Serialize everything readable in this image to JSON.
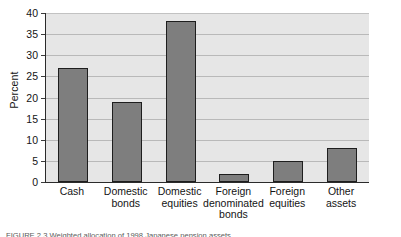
{
  "chart_data": {
    "type": "bar",
    "title": "",
    "xlabel": "",
    "ylabel": "Percent",
    "ylim": [
      0,
      40
    ],
    "ytick_step": 5,
    "grid": true,
    "legend": false,
    "categories": [
      "Cash",
      "Domestic bonds",
      "Domestic equities",
      "Foreign denominated bonds",
      "Foreign equities",
      "Other assets"
    ],
    "category_lines": [
      [
        "Cash"
      ],
      [
        "Domestic",
        "bonds"
      ],
      [
        "Domestic",
        "equities"
      ],
      [
        "Foreign",
        "denominated",
        "bonds"
      ],
      [
        "Foreign",
        "equities"
      ],
      [
        "Other",
        "assets"
      ]
    ],
    "values": [
      27,
      19,
      38,
      2,
      5,
      8
    ],
    "ytick_labels": [
      "0",
      "5",
      "10",
      "15",
      "20",
      "25",
      "30",
      "35",
      "40"
    ]
  },
  "axis": {
    "y_title": "Percent"
  },
  "colors": {
    "bar_fill": "#7e7e7e",
    "bar_outline": "#1e1e1e",
    "plot_background": "#e6e6e6",
    "gridline": "#b9b9b9",
    "axis_line": "#2b2b2b",
    "text": "#141414",
    "page_background": "#ffffff"
  },
  "caption": {
    "heading": "FIGURE",
    "text": "FIGURE   2.3   Weighted allocation of 1998 Japanese pension assets"
  }
}
